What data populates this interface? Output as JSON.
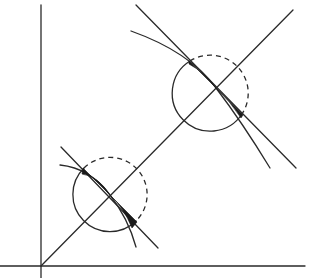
{
  "diagram": {
    "colors": {
      "stroke": "#2a2a2a",
      "fill": "#1a1a1a",
      "background": "#ffffff"
    },
    "axes": {
      "origin": [
        41,
        266
      ],
      "y_axis": {
        "x": 41,
        "y_top": 5,
        "y_bottom": 278
      },
      "x_axis": {
        "y": 266,
        "x_left": 0,
        "x_right": 305
      }
    },
    "diagonal": {
      "from": [
        41,
        266
      ],
      "to": [
        293,
        10
      ]
    },
    "circles": [
      {
        "name": "lower",
        "cx": 110,
        "cy": 195,
        "r": 37,
        "solid_part": "left/bottom",
        "dashed_part": "top/right"
      },
      {
        "name": "upper",
        "cx": 216,
        "cy": 88,
        "r": 38,
        "solid_part": "left/bottom",
        "dashed_part": "top/right"
      }
    ],
    "labels": []
  }
}
